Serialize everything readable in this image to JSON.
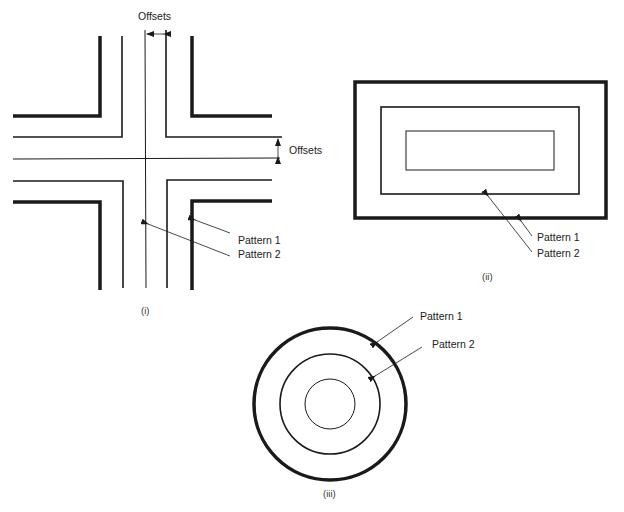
{
  "figure_i": {
    "caption": "(i)",
    "offsets_top_label": "Offsets",
    "offsets_right_label": "Offsets",
    "pattern1_label": "Pattern 1",
    "pattern2_label": "Pattern 2"
  },
  "figure_ii": {
    "caption": "(ii)",
    "pattern1_label": "Pattern 1",
    "pattern2_label": "Pattern 2"
  },
  "figure_iii": {
    "caption": "(iii)",
    "pattern1_label": "Pattern 1",
    "pattern2_label": "Pattern 2"
  },
  "colors": {
    "line": "#1a1a1a",
    "background": "#ffffff"
  }
}
